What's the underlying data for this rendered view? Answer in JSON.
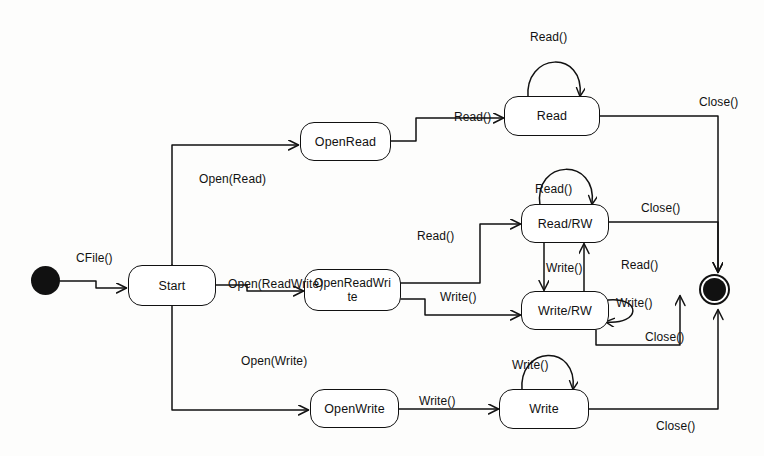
{
  "diagram": {
    "kind": "uml-state-machine",
    "colors": {
      "stroke": "#111111",
      "fill": "#ffffff",
      "background": "#fdfdfc"
    },
    "pseudo_states": [
      {
        "id": "initial",
        "name": "initial-state",
        "shape": "filled-circle"
      },
      {
        "id": "final",
        "name": "final-state",
        "shape": "bullseye-circle"
      }
    ],
    "states": [
      {
        "id": "start",
        "label": "Start"
      },
      {
        "id": "openread",
        "label": "OpenRead"
      },
      {
        "id": "openreadwrite",
        "label": "OpenReadWri",
        "label2": "te"
      },
      {
        "id": "openwrite",
        "label": "OpenWrite"
      },
      {
        "id": "read",
        "label": "Read"
      },
      {
        "id": "readrw",
        "label": "Read/RW"
      },
      {
        "id": "writerw",
        "label": "Write/RW"
      },
      {
        "id": "write",
        "label": "Write"
      }
    ],
    "transitions": [
      {
        "id": "t-cfile",
        "from": "initial",
        "to": "start",
        "label": "CFile()"
      },
      {
        "id": "t-openread",
        "from": "start",
        "to": "openread",
        "label": "Open(Read)"
      },
      {
        "id": "t-openrw",
        "from": "start",
        "to": "openreadwrite",
        "label": "Open(ReadWrite)"
      },
      {
        "id": "t-openwrite",
        "from": "start",
        "to": "openwrite",
        "label": "Open(Write)"
      },
      {
        "id": "t-or-read",
        "from": "openread",
        "to": "read",
        "label": "Read()"
      },
      {
        "id": "t-orw-read",
        "from": "openreadwrite",
        "to": "readrw",
        "label": "Read()"
      },
      {
        "id": "t-orw-write",
        "from": "openreadwrite",
        "to": "writerw",
        "label": "Write()"
      },
      {
        "id": "t-ow-write",
        "from": "openwrite",
        "to": "write",
        "label": "Write()"
      },
      {
        "id": "t-read-self",
        "from": "read",
        "to": "read",
        "label": "Read()"
      },
      {
        "id": "t-readrw-self",
        "from": "readrw",
        "to": "readrw",
        "label": "Read()"
      },
      {
        "id": "t-writerw-self",
        "from": "writerw",
        "to": "writerw",
        "label": "Write()"
      },
      {
        "id": "t-write-self",
        "from": "write",
        "to": "write",
        "label": "Write()"
      },
      {
        "id": "t-rw-to-wrw",
        "from": "readrw",
        "to": "writerw",
        "label": "Write()"
      },
      {
        "id": "t-wrw-to-rrw",
        "from": "writerw",
        "to": "readrw",
        "label": "Read()"
      },
      {
        "id": "t-read-close",
        "from": "read",
        "to": "final",
        "label": "Close()"
      },
      {
        "id": "t-readrw-close",
        "from": "readrw",
        "to": "final",
        "label": "Close()"
      },
      {
        "id": "t-writerw-close",
        "from": "writerw",
        "to": "final",
        "label": "Close()"
      },
      {
        "id": "t-write-close",
        "from": "write",
        "to": "final",
        "label": "Close()"
      }
    ],
    "labels": {
      "cfile": "CFile()",
      "open_read": "Open(Read)",
      "open_rw": "Open(ReadWrite)",
      "open_write": "Open(Write)",
      "read_call_1": "Read()",
      "read_call_2": "Read()",
      "read_call_3": "Read()",
      "read_self": "Read()",
      "readrw_self": "Read()",
      "write_call_1": "Write()",
      "write_call_2": "Write()",
      "write_self": "Write()",
      "writerw_self": "Write()",
      "write_down": "Write()",
      "close_1": "Close()",
      "close_2": "Close()",
      "close_3": "Close()",
      "close_4": "Close()"
    }
  }
}
